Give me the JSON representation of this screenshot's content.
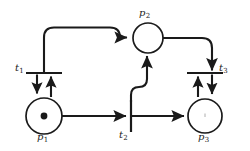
{
  "figure": {
    "kind": "petri-net",
    "background_color": "#ffffff",
    "stroke_color": "#1a1a1a",
    "width": 250,
    "height": 151
  },
  "places": [
    {
      "id": "p1",
      "label": "p",
      "subscript": "1",
      "cx": 44,
      "cy": 116,
      "r": 18,
      "tokens": 1,
      "label_x": 37,
      "label_y": 131
    },
    {
      "id": "p2",
      "label": "p",
      "subscript": "2",
      "cx": 148,
      "cy": 38,
      "r": 15,
      "tokens": 0,
      "label_x": 139,
      "label_y": 8
    },
    {
      "id": "p3",
      "label": "p",
      "subscript": "3",
      "cx": 205,
      "cy": 116,
      "r": 17,
      "tokens": 0,
      "label_x": 198,
      "label_y": 131
    }
  ],
  "transitions": [
    {
      "id": "t1",
      "label": "t",
      "subscript": "1",
      "orientation": "horizontal",
      "x": 44,
      "y": 73,
      "half_length": 18,
      "label_x": 15,
      "label_y": 64
    },
    {
      "id": "t2",
      "label": "t",
      "subscript": "2",
      "orientation": "vertical",
      "x": 131,
      "y": 116,
      "half_length": 16,
      "label_x": 119,
      "label_y": 130
    },
    {
      "id": "t3",
      "label": "t",
      "subscript": "3",
      "orientation": "horizontal",
      "x": 205,
      "y": 73,
      "half_length": 18,
      "label_x": 219,
      "label_y": 64
    }
  ],
  "arcs": [
    {
      "id": "arc-t1-to-p2",
      "from": "t1",
      "to": "p2",
      "shape": "elbow-up-right",
      "arrowhead": "at-p2-left"
    },
    {
      "id": "arc-t1-to-p1",
      "from": "t1",
      "to": "p1",
      "shape": "straight-down",
      "arrowhead": "at-p1-top-left"
    },
    {
      "id": "arc-p1-to-t1",
      "from": "p1",
      "to": "t1",
      "shape": "straight-up",
      "arrowhead": "at-t1-bar"
    },
    {
      "id": "arc-p1-to-t2",
      "from": "p1",
      "to": "t2",
      "shape": "straight-right",
      "arrowhead": "at-t2-bar"
    },
    {
      "id": "arc-t2-to-p2",
      "from": "t2",
      "to": "p2",
      "shape": "curve-up-right-then-up",
      "arrowhead": "at-p2-bottom"
    },
    {
      "id": "arc-t2-to-p3",
      "from": "t2",
      "to": "p3",
      "shape": "straight-right",
      "arrowhead": "at-p3-left"
    },
    {
      "id": "arc-p2-to-t3",
      "from": "p2",
      "to": "t3",
      "shape": "elbow-right-down",
      "arrowhead": "at-t3-bar"
    },
    {
      "id": "arc-t3-to-p3",
      "from": "t3",
      "to": "p3",
      "shape": "straight-down",
      "arrowhead": "at-p3-top-right"
    },
    {
      "id": "arc-p3-to-t3",
      "from": "p3",
      "to": "t3",
      "shape": "straight-up",
      "arrowhead": "at-t3-bar-left"
    }
  ],
  "labels": {
    "p1": "p",
    "p1_sub": "1",
    "p2": "p",
    "p2_sub": "2",
    "p3": "p",
    "p3_sub": "3",
    "t1": "t",
    "t1_sub": "1",
    "t2": "t",
    "t2_sub": "2",
    "t3": "t",
    "t3_sub": "3"
  }
}
